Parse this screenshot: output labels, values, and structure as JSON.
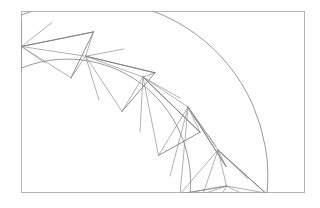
{
  "figure": {
    "canvas": {
      "width": 320,
      "height": 208,
      "background": "#ffffff"
    },
    "frame": {
      "label": "plot-border",
      "x": 21,
      "y": 11,
      "width": 284,
      "height": 182,
      "stroke": "#b4b4b4",
      "stroke_width": 1
    },
    "annulus": {
      "center_x": -14,
      "center_y": 191,
      "inner_radius": 123,
      "outer_radius": 176,
      "start_angle_deg": 180.0,
      "end_angle_deg": 90.0,
      "segments": 6,
      "description": "Curved band swept a quarter turn, subdivided into six trapezoidal cells"
    },
    "colors": {
      "frame": "#b4b4b4",
      "arc": "#808080",
      "radial": "#6e6e6e",
      "fan": "#909090",
      "chord": "#5a5a5a",
      "baseline": "#9a9a9a"
    },
    "stroke_widths": {
      "frame": 1,
      "arc": 0.8,
      "radial": 0.8,
      "fan": 0.7,
      "chord": 0.9
    },
    "inner_arc_vertices": [
      {
        "name": "i0",
        "x": 21.0,
        "y": 70.8
      },
      {
        "name": "i1",
        "x": 34.9,
        "y": 47.9
      },
      {
        "name": "i2",
        "x": 85.6,
        "y": 56.2
      },
      {
        "name": "i3",
        "x": 128.6,
        "y": 84.8
      },
      {
        "name": "i4",
        "x": 160.1,
        "y": 126.3
      },
      {
        "name": "i5",
        "x": 177.2,
        "y": 175.2
      },
      {
        "name": "i6",
        "x": 190.0,
        "y": 193.0
      }
    ],
    "outer_arc_vertices": [
      {
        "name": "o0",
        "x": 21.0,
        "y": 19.9
      },
      {
        "name": "o1",
        "x": 21.0,
        "y": 19.9
      },
      {
        "name": "o2",
        "x": 93.5,
        "y": 31.9
      },
      {
        "name": "o3",
        "x": 155.0,
        "y": 72.8
      },
      {
        "name": "o4",
        "x": 200.0,
        "y": 132.2
      },
      {
        "name": "o5",
        "x": 224.5,
        "y": 201.9
      },
      {
        "name": "o6",
        "x": 267.0,
        "y": 193.0
      }
    ],
    "fan_apexes": [
      {
        "name": "apex-1",
        "x": 21.5,
        "y": 46.5,
        "spokes": 6
      },
      {
        "name": "apex-2",
        "x": 85.6,
        "y": 56.2,
        "spokes": 6
      },
      {
        "name": "apex-3",
        "x": 143.0,
        "y": 77.0,
        "spokes": 6
      },
      {
        "name": "apex-4",
        "x": 188.0,
        "y": 107.0,
        "spokes": 6
      },
      {
        "name": "apex-5",
        "x": 218.0,
        "y": 150.0,
        "spokes": 6
      },
      {
        "name": "apex-6",
        "x": 226.0,
        "y": 186.0,
        "spokes": 5
      }
    ],
    "chords": [
      {
        "name": "chord-1",
        "x1": 21.5,
        "y1": 46.5,
        "x2": 93.5,
        "y2": 31.9
      },
      {
        "name": "chord-2",
        "x1": 85.6,
        "y1": 56.2,
        "x2": 155.0,
        "y2": 72.8
      },
      {
        "name": "chord-3",
        "x1": 143.0,
        "y1": 77.0,
        "x2": 200.0,
        "y2": 132.2
      },
      {
        "name": "chord-4",
        "x1": 188.0,
        "y1": 107.0,
        "x2": 224.5,
        "y2": 165.0
      },
      {
        "name": "chord-5",
        "x1": 218.0,
        "y1": 150.0,
        "x2": 265.0,
        "y2": 193.0
      }
    ],
    "radial_cuts": [
      {
        "name": "radial-cut-0",
        "x1": 21.0,
        "y1": 19.9,
        "x2": 21.0,
        "y2": 70.8
      },
      {
        "name": "radial-cut-1",
        "x1": 93.5,
        "y1": 31.9,
        "x2": 71.0,
        "y2": 77.8
      },
      {
        "name": "radial-cut-2",
        "x1": 155.0,
        "y1": 72.8,
        "x2": 122.0,
        "y2": 111.0
      },
      {
        "name": "radial-cut-3",
        "x1": 200.0,
        "y1": 132.2,
        "x2": 158.0,
        "y2": 155.0
      },
      {
        "name": "radial-cut-4",
        "x1": 226.5,
        "y1": 186.0,
        "x2": 180.0,
        "y2": 193.0
      },
      {
        "name": "radial-cut-5",
        "x1": 267.0,
        "y1": 193.0,
        "x2": 190.0,
        "y2": 193.0
      }
    ],
    "legend_note": "No axis labels, legend, or tick marks are present in the figure."
  }
}
